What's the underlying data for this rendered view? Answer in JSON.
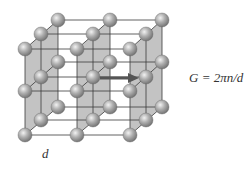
{
  "figure": {
    "equation": "G = 2πn/d",
    "spacing_label": "d",
    "colors": {
      "plane_fill": "#b9b9b9",
      "grid_line": "#444444",
      "atom": "#9a9a9a",
      "arrow": "#555555"
    },
    "lattice": {
      "layers_y_offsets": [
        0,
        42,
        86
      ],
      "rows": [
        {
          "y": 20,
          "x": [
            58,
            110,
            162
          ]
        },
        {
          "y": 34,
          "x": [
            41,
            93,
            146
          ]
        },
        {
          "y": 49,
          "x": [
            25,
            77,
            130
          ]
        }
      ]
    }
  }
}
